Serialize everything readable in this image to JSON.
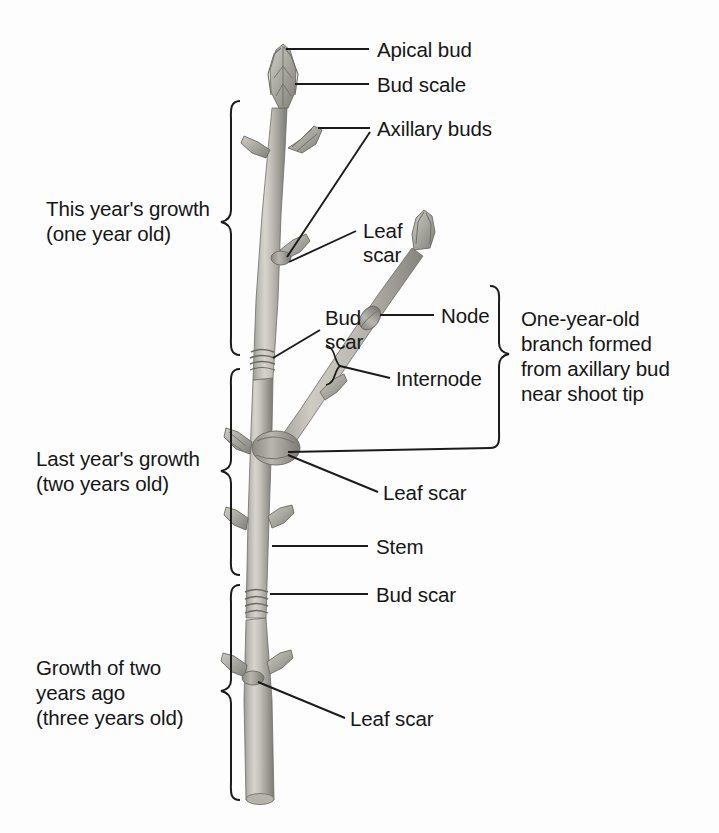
{
  "figure": {
    "background_color": "#fdfdfd",
    "line_color": "#1b1b1b",
    "caption": ""
  },
  "labels": {
    "apical_bud": "Apical bud",
    "bud_scale": "Bud scale",
    "axillary_buds": "Axillary buds",
    "leaf_scar_upper": "Leaf\nscar",
    "bud_scar_upper": "Bud\nscar",
    "node": "Node",
    "internode": "Internode",
    "leaf_scar_mid": "Leaf scar",
    "stem": "Stem",
    "bud_scar_lower": "Bud scar",
    "leaf_scar_lower": "Leaf scar"
  },
  "brackets": {
    "this_years_growth": "This year's growth\n(one year old)",
    "last_years_growth": "Last year's growth\n(two years old)",
    "growth_two_years_ago": "Growth of two\nyears ago\n(three years old)",
    "one_year_old_branch": "One-year-old\nbranch formed\nfrom axillary bud\nnear shoot tip"
  },
  "structure": {
    "main_stem": "main-twig",
    "side_branch": "lateral-one-year-old-branch",
    "apical_bud_shape": "terminal-bud",
    "lateral_bud_shape": "axillary-bud"
  }
}
